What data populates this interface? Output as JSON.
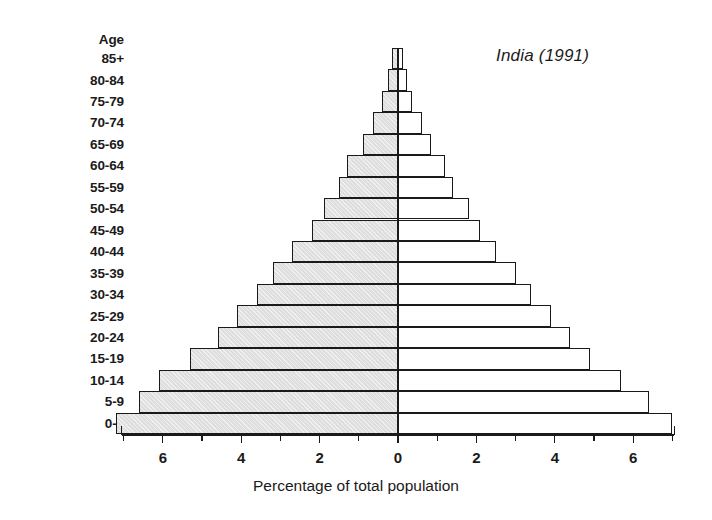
{
  "chart_data": {
    "type": "bar",
    "subtype": "population-pyramid",
    "title": "India (1991)",
    "xlabel": "Percentage of total population",
    "ylabel": "Age",
    "categories": [
      "0-4",
      "5-9",
      "10-14",
      "15-19",
      "20-24",
      "25-29",
      "30-34",
      "35-39",
      "40-44",
      "45-49",
      "50-54",
      "55-59",
      "60-64",
      "65-69",
      "70-74",
      "75-79",
      "80-84",
      "85+"
    ],
    "series": [
      {
        "name": "Males",
        "values": [
          7.2,
          6.6,
          6.1,
          5.3,
          4.6,
          4.1,
          3.6,
          3.2,
          2.7,
          2.2,
          1.9,
          1.5,
          1.3,
          0.9,
          0.65,
          0.4,
          0.25,
          0.15
        ]
      },
      {
        "name": "Females",
        "values": [
          7.0,
          6.4,
          5.7,
          4.9,
          4.4,
          3.9,
          3.4,
          3.0,
          2.5,
          2.1,
          1.8,
          1.4,
          1.2,
          0.85,
          0.6,
          0.35,
          0.22,
          0.13
        ]
      }
    ],
    "xticks_left": [
      "6",
      "4",
      "2"
    ],
    "xticks_right": [
      "2",
      "4",
      "6"
    ],
    "xtick_center": "0",
    "xlim": [
      -7.4,
      7.4
    ],
    "grid": false,
    "legend_position": "inline-callout",
    "colors": {
      "male_fill": "#dedede",
      "female_fill": "#ffffff",
      "outline": "#1a1a1a"
    }
  },
  "axes": {
    "age_header": "Age",
    "x_title": "Percentage of total population",
    "tick_labels": [
      "6",
      "4",
      "2",
      "0",
      "2",
      "4",
      "6"
    ]
  },
  "callouts": {
    "males": "Males",
    "females": "Females"
  },
  "title": "India (1991)"
}
